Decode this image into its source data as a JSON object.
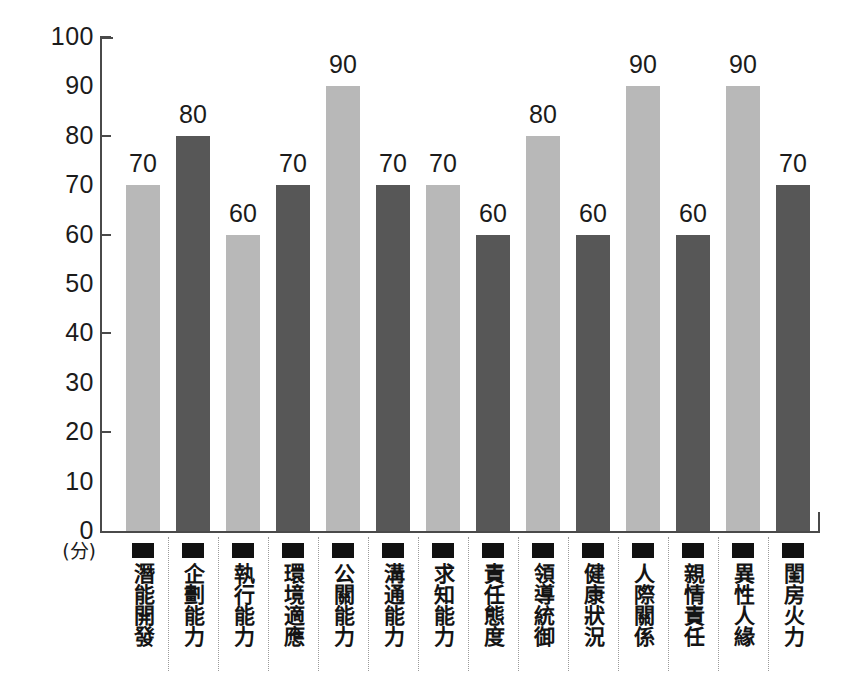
{
  "chart_data": {
    "type": "bar",
    "title": "",
    "subtitle": "",
    "xlabel": "",
    "ylabel": "",
    "yunit": "(分)",
    "ylim": [
      0,
      100
    ],
    "ystep": 10,
    "grid": false,
    "legend": "none",
    "ytick_labels": [
      "100",
      "90",
      "80",
      "70",
      "60",
      "50",
      "40",
      "30",
      "20",
      "10",
      "0"
    ],
    "ytick_values": [
      100,
      90,
      80,
      70,
      60,
      50,
      40,
      30,
      20,
      10,
      0
    ],
    "major_ticks": [
      100,
      80,
      60,
      40,
      20,
      0
    ],
    "categories": [
      "潛能開發",
      "企劃能力",
      "執行能力",
      "環境適應",
      "公關能力",
      "溝通能力",
      "求知能力",
      "責任態度",
      "領導統御",
      "健康狀況",
      "人際關係",
      "親情責任",
      "異性人緣",
      "閨房火力"
    ],
    "values": [
      70,
      80,
      60,
      70,
      90,
      70,
      70,
      60,
      80,
      60,
      90,
      60,
      90,
      70
    ],
    "bar_colors": [
      "#b8b8b8",
      "#575757",
      "#b8b8b8",
      "#575757",
      "#b8b8b8",
      "#575757",
      "#b8b8b8",
      "#575757",
      "#b8b8b8",
      "#575757",
      "#b8b8b8",
      "#575757",
      "#b8b8b8",
      "#575757"
    ],
    "marker_color": "#111111",
    "axis_color": "#4a4a4a",
    "background": "#ffffff"
  }
}
